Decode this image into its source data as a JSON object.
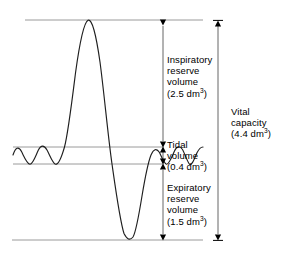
{
  "figure": {
    "type": "spirogram",
    "line_color": "#222222",
    "guide_color": "#9a9a9a",
    "arrow_color": "#000000"
  },
  "labels": {
    "irv": {
      "line1": "Inspiratory",
      "line2": "reserve",
      "line3": "volume",
      "value_prefix": "(2.5 dm",
      "value_sup": "3",
      "value_suffix": ")"
    },
    "tv": {
      "line1": "Tidal",
      "line2": "volume",
      "value_prefix": "(0.4 dm",
      "value_sup": "3",
      "value_suffix": ")"
    },
    "erv": {
      "line1": "Expiratory",
      "line2": "reserve",
      "line3": "volume",
      "value_prefix": "(1.5 dm",
      "value_sup": "3",
      "value_suffix": ")"
    },
    "vc": {
      "line1": "Vital",
      "line2": "capacity",
      "value_prefix": "(4.4 dm",
      "value_sup": "3",
      "value_suffix": ")"
    }
  },
  "chart_data": {
    "type": "line",
    "title": "",
    "xlabel": "",
    "ylabel": "",
    "units": "dm3",
    "guide_lines": [
      {
        "name": "maximum-inspiration-level",
        "y_px": 20,
        "x_start": 25,
        "x_end": 203
      },
      {
        "name": "tidal-upper-level",
        "y_px": 147,
        "x_start": 13,
        "x_end": 164
      },
      {
        "name": "tidal-lower-level",
        "y_px": 164,
        "x_start": 13,
        "x_end": 164
      },
      {
        "name": "maximum-expiration-level",
        "y_px": 240,
        "x_start": 12,
        "x_end": 203
      }
    ],
    "volumes": [
      {
        "name": "Inspiratory reserve volume",
        "value": 2.5,
        "unit": "dm3",
        "from_y_px": 20,
        "to_y_px": 147
      },
      {
        "name": "Tidal volume",
        "value": 0.4,
        "unit": "dm3",
        "from_y_px": 147,
        "to_y_px": 164
      },
      {
        "name": "Expiratory reserve volume",
        "value": 1.5,
        "unit": "dm3",
        "from_y_px": 164,
        "to_y_px": 240
      },
      {
        "name": "Vital capacity",
        "value": 4.4,
        "unit": "dm3",
        "from_y_px": 20,
        "to_y_px": 240
      }
    ],
    "arrows": [
      {
        "name": "irv-arrow",
        "x_px": 163,
        "y1_px": 20,
        "y2_px": 147,
        "heads": "both"
      },
      {
        "name": "tv-arrow",
        "x_px": 163,
        "y1_px": 147,
        "y2_px": 164,
        "heads": "both"
      },
      {
        "name": "erv-arrow",
        "x_px": 163,
        "y1_px": 164,
        "y2_px": 240,
        "heads": "both"
      },
      {
        "name": "vc-arrow",
        "x_px": 218,
        "y1_px": 20,
        "y2_px": 240,
        "heads": "both"
      }
    ],
    "trace_path": "M 13,155 C 16,147 19,146 22,152 C 25,158 27,164 30,164 C 33,164 35,156 38,150 C 41,145 44,145 47,150 C 50,155 52,163 55,164 C 58,165 61,158 64,147 C 68,134 72,104 76,72 C 80,44 84,23 88,20 C 92,18 96,34 100,62 C 104,92 108,136 112,164 C 116,192 120,222 124,234 C 127,240 130,241 133,237 C 136,232 139,214 142,196 C 145,178 148,162 151,155 C 154,149 157,148 160,153 C 162,157 164,163 166,164 C 169,165 171,158 174,151 C 176,146 179,145 182,149 C 184,153 186,161 189,164 C 191,166 194,160 197,153 C 199,149 201,147 203,147",
    "trace_points_note": "Smooth spirometer trace: tidal breathing, deep inspiration peak at top line, maximal expiration trough at bottom line, return to tidal breathing"
  }
}
